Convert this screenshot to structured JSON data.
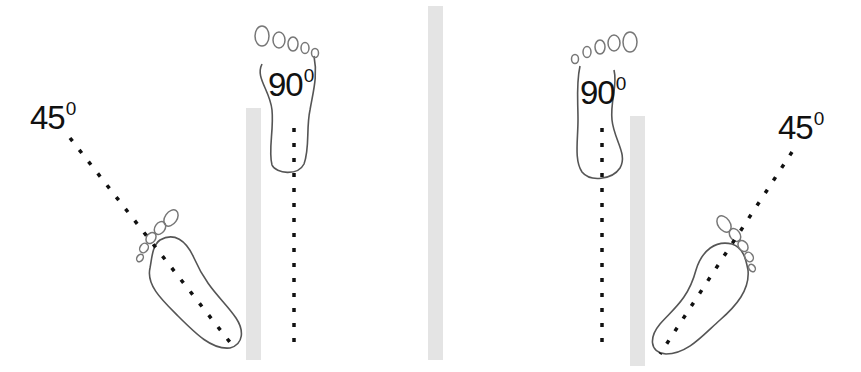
{
  "diagram": {
    "panels": [
      {
        "id": "left",
        "labels": {
          "angle_45": "45",
          "angle_90": "90",
          "degree": "0"
        },
        "walls": 1,
        "feet": [
          "angled-45-foot",
          "straight-90-foot"
        ]
      },
      {
        "id": "right",
        "labels": {
          "angle_45": "45",
          "angle_90": "90",
          "degree": "0"
        },
        "walls": 1,
        "feet": [
          "straight-90-foot",
          "angled-45-foot"
        ]
      }
    ],
    "divider": "center-wall",
    "colors": {
      "wall": "#e4e4e4",
      "foot_outline": "#555555",
      "dash": "#111111",
      "background": "#ffffff"
    }
  }
}
